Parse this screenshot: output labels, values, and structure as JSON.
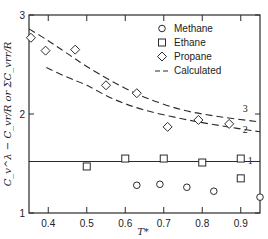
{
  "chart_data": {
    "type": "scatter",
    "title": "",
    "xlabel": "T*",
    "ylabel": "C_v^λ − C_vr/R or ΣC_vrr/R",
    "xlim": [
      0.35,
      0.95
    ],
    "ylim": [
      1,
      3
    ],
    "x_ticks": [
      0.4,
      0.5,
      0.6,
      0.7,
      0.8,
      0.9
    ],
    "x_tick_labels": [
      "0.4",
      "0.5",
      "0.6",
      "0.7",
      "0.8",
      "0.9"
    ],
    "y_ticks": [
      1,
      2,
      3
    ],
    "y_tick_labels": [
      "1",
      "2",
      "3"
    ],
    "grid": false,
    "legend_position": "upper right",
    "legend": [
      {
        "label": "Methane",
        "marker": "circle"
      },
      {
        "label": "Ethane",
        "marker": "square"
      },
      {
        "label": "Propane",
        "marker": "diamond"
      },
      {
        "label": "Calculated",
        "marker": "dashed-line"
      }
    ],
    "series": [
      {
        "name": "Methane",
        "marker": "circle",
        "x": [
          0.63,
          0.69,
          0.76,
          0.83,
          0.95
        ],
        "y": [
          1.28,
          1.29,
          1.26,
          1.22,
          1.16
        ]
      },
      {
        "name": "Ethane",
        "marker": "square",
        "x": [
          0.5,
          0.6,
          0.7,
          0.8,
          0.9,
          0.9
        ],
        "y": [
          1.47,
          1.55,
          1.55,
          1.51,
          1.55,
          1.35
        ]
      },
      {
        "name": "Propane",
        "marker": "diamond",
        "x": [
          0.355,
          0.393,
          0.47,
          0.55,
          0.63,
          0.71,
          0.79,
          0.87
        ],
        "y": [
          2.77,
          2.64,
          2.65,
          2.29,
          2.21,
          1.87,
          1.94,
          1.9
        ]
      }
    ],
    "lines": [
      {
        "name": "Calculated 1",
        "label": "1",
        "style": "solid",
        "x": [
          0.35,
          0.95
        ],
        "y": [
          1.52,
          1.52
        ]
      },
      {
        "name": "Calculated 2",
        "label": "2",
        "style": "dashed",
        "x": [
          0.395,
          0.45,
          0.5,
          0.57,
          0.65,
          0.75,
          0.85,
          0.95
        ],
        "y": [
          2.47,
          2.37,
          2.29,
          2.15,
          2.04,
          1.95,
          1.88,
          1.82
        ]
      },
      {
        "name": "Calculated 3",
        "label": "3",
        "style": "dashed",
        "x": [
          0.35,
          0.4,
          0.45,
          0.5,
          0.57,
          0.65,
          0.75,
          0.85,
          0.95
        ],
        "y": [
          2.86,
          2.74,
          2.61,
          2.48,
          2.32,
          2.17,
          2.04,
          1.97,
          1.92
        ]
      }
    ],
    "curve_labels": [
      {
        "text": "3",
        "x": 0.905,
        "y": 2.02
      },
      {
        "text": "2",
        "x": 0.905,
        "y": 1.81
      },
      {
        "text": "1",
        "x": 0.918,
        "y": 1.49
      }
    ]
  }
}
